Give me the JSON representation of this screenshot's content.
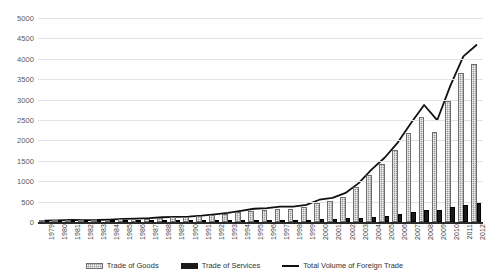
{
  "chart_data": {
    "type": "bar",
    "title": "",
    "subtitle": "",
    "xlabel": "",
    "ylabel": "",
    "ylim": [
      0,
      5000
    ],
    "ytick_values": [
      0,
      500,
      1000,
      1500,
      2000,
      2500,
      3000,
      3500,
      4000,
      4500,
      5000
    ],
    "ytick_labels": [
      "0",
      "500",
      "1000",
      "1500",
      "2000",
      "2500",
      "3000",
      "3500",
      "4000",
      "4500",
      "5000"
    ],
    "grid": true,
    "legend_position": "bottom",
    "categories": [
      "1979",
      "1980",
      "1981",
      "1982",
      "1983",
      "1984",
      "1985",
      "1986",
      "1987",
      "1988",
      "1989",
      "1990",
      "1991",
      "1992",
      "1993",
      "1994",
      "1995",
      "1996",
      "1997",
      "1998",
      "1999",
      "2000",
      "2001",
      "2002",
      "2003",
      "2004",
      "2005",
      "2006",
      "2007",
      "2008",
      "2009",
      "2010",
      "2011",
      "2012"
    ],
    "series": [
      {
        "name": "Trade of Goods",
        "style": "bar-hatched-gray",
        "color": "#9a9a9a",
        "values": [
          29,
          38,
          44,
          42,
          44,
          54,
          70,
          74,
          83,
          103,
          112,
          115,
          136,
          166,
          196,
          236,
          281,
          290,
          325,
          324,
          361,
          474,
          510,
          621,
          851,
          1155,
          1422,
          1760,
          2174,
          2563,
          2208,
          2974,
          3642,
          3867
        ]
      },
      {
        "name": "Trade of Services",
        "style": "bar-solid-black",
        "color": "#1a1a1a",
        "values": [
          3,
          4,
          5,
          5,
          5,
          6,
          8,
          9,
          11,
          13,
          15,
          16,
          18,
          21,
          26,
          35,
          44,
          48,
          52,
          53,
          58,
          72,
          81,
          92,
          102,
          134,
          158,
          192,
          251,
          305,
          287,
          362,
          419,
          471
        ]
      },
      {
        "name": "Total Volume of Foreign Trade",
        "style": "line",
        "color": "#111111",
        "values": [
          32,
          42,
          49,
          47,
          49,
          60,
          78,
          83,
          94,
          116,
          127,
          131,
          154,
          187,
          222,
          271,
          325,
          338,
          377,
          377,
          419,
          546,
          591,
          713,
          953,
          1289,
          1580,
          1952,
          2425,
          2868,
          2495,
          3336,
          4061,
          4338
        ]
      }
    ]
  },
  "legend": {
    "items": [
      {
        "label": "Trade of Goods"
      },
      {
        "label": "Trade of Services"
      },
      {
        "label": "Total Volume of Foreign Trade"
      }
    ]
  }
}
